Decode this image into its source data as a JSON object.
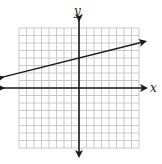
{
  "chart_data": {
    "type": "line",
    "title": "",
    "xlabel": "x",
    "ylabel": "y",
    "grid": true,
    "xlim": [
      -8,
      8
    ],
    "ylim": [
      -8,
      8
    ],
    "series": [
      {
        "name": "line",
        "equation": "y = (1/4)x + 4",
        "points": [
          [
            -8,
            2
          ],
          [
            0,
            4
          ],
          [
            8,
            6
          ]
        ],
        "arrows": "both"
      }
    ]
  },
  "labels": {
    "x_axis": "x",
    "y_axis": "y"
  },
  "colors": {
    "grid": "#bdbdbd",
    "axis": "#1a1a1a",
    "line": "#1a1a1a"
  }
}
